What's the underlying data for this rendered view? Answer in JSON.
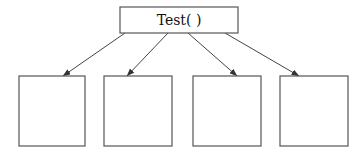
{
  "diagram": {
    "type": "tree",
    "root": {
      "label": "Test( )",
      "x": 120,
      "y": 7,
      "width": 118,
      "height": 26
    },
    "children": [
      {
        "id": "child-1",
        "label": "",
        "x": 19,
        "y": 76,
        "width": 66,
        "height": 70
      },
      {
        "id": "child-2",
        "label": "",
        "x": 104,
        "y": 76,
        "width": 68,
        "height": 70
      },
      {
        "id": "child-3",
        "label": "",
        "x": 193,
        "y": 76,
        "width": 68,
        "height": 70
      },
      {
        "id": "child-4",
        "label": "",
        "x": 280,
        "y": 76,
        "width": 68,
        "height": 70
      }
    ],
    "edges": [
      {
        "from": "root",
        "to": "child-1",
        "x1": 125,
        "y1": 33,
        "x2": 63,
        "y2": 76
      },
      {
        "from": "root",
        "to": "child-2",
        "x1": 168,
        "y1": 33,
        "x2": 127,
        "y2": 76
      },
      {
        "from": "root",
        "to": "child-3",
        "x1": 188,
        "y1": 33,
        "x2": 237,
        "y2": 76
      },
      {
        "from": "root",
        "to": "child-4",
        "x1": 225,
        "y1": 33,
        "x2": 299,
        "y2": 76
      }
    ],
    "colors": {
      "stroke": "#555555",
      "arrow": "#444444",
      "text": "#111111",
      "background": "#ffffff"
    }
  }
}
